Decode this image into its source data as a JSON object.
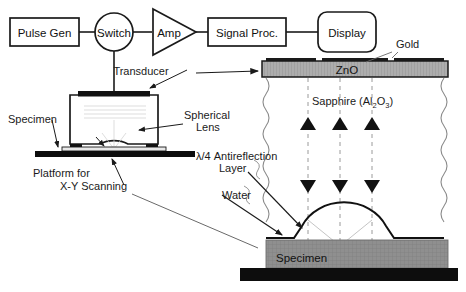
{
  "figure": {
    "colors": {
      "line": "#1a1a1a",
      "gold": "#1a1a1a",
      "zno_fill": "#a8a8a8",
      "specimen_fill": "#8c8c8c",
      "platform_fill": "#0d0d0d",
      "ray_dash": "#9a9a9a",
      "leader": "#555555"
    }
  },
  "block_diagram": {
    "nodes": [
      {
        "id": "pulse-gen",
        "label": "Pulse Gen",
        "shape": "rect"
      },
      {
        "id": "switch",
        "label": "Switch",
        "shape": "circle"
      },
      {
        "id": "amp",
        "label": "Amp",
        "shape": "triangle"
      },
      {
        "id": "signal-proc",
        "label": "Signal Proc.",
        "shape": "rect"
      },
      {
        "id": "display",
        "label": "Display",
        "shape": "rounded-rect"
      }
    ]
  },
  "left_panel": {
    "labels": {
      "transducer": "Transducer",
      "specimen": "Specimen",
      "spherical_lens_line1": "Spherical",
      "spherical_lens_line2": "Lens",
      "platform_line1": "Platform for",
      "platform_line2": "X-Y Scanning"
    }
  },
  "right_panel": {
    "labels": {
      "gold": "Gold",
      "zno": "ZnO",
      "sapphire_main": "Sapphire (Al",
      "sapphire_sub1": "2",
      "sapphire_mid": "O",
      "sapphire_sub2": "3",
      "sapphire_close": ")",
      "antireflection_line1_lambda": "λ",
      "antireflection_line1_rest": "/4 Antireflection",
      "antireflection_line2": "Layer",
      "water": "Water",
      "specimen": "Specimen"
    },
    "rays": {
      "count": 3,
      "x_positions": [
        308,
        340,
        372
      ],
      "up_triangle_y": 122,
      "down_triangle_y": 186
    }
  }
}
